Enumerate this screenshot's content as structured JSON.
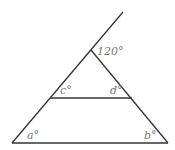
{
  "diagram": {
    "type": "geometry-triangle-with-parallel-line",
    "stroke_color": "#333333",
    "label_color": "#777777",
    "points": {
      "ray_end": {
        "x": 123,
        "y": 12
      },
      "apex": {
        "x": 91,
        "y": 50
      },
      "mid_left": {
        "x": 50,
        "y": 98
      },
      "mid_right": {
        "x": 132,
        "y": 98
      },
      "base_left": {
        "x": 12,
        "y": 143
      },
      "base_right": {
        "x": 168,
        "y": 143
      }
    },
    "labels": {
      "exterior_angle": "120°",
      "c": "c°",
      "d": "d°",
      "a": "a°",
      "b": "b°"
    }
  }
}
